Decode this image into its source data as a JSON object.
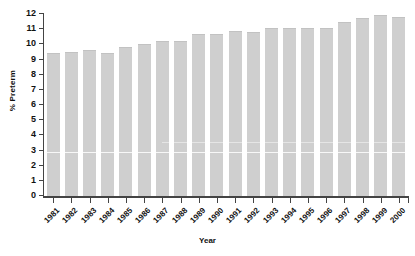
{
  "chart_data": {
    "type": "bar",
    "title": "",
    "xlabel": "Year",
    "ylabel": "% Preterm",
    "categories": [
      "1981",
      "1982",
      "1983",
      "1984",
      "1985",
      "1986",
      "1987",
      "1988",
      "1989",
      "1990",
      "1991",
      "1992",
      "1993",
      "1994",
      "1995",
      "1996",
      "1997",
      "1998",
      "1999",
      "2000"
    ],
    "values": [
      9.4,
      9.5,
      9.6,
      9.4,
      9.8,
      10.0,
      10.25,
      10.25,
      10.65,
      10.65,
      10.9,
      10.8,
      11.05,
      11.05,
      11.05,
      11.05,
      11.5,
      11.75,
      11.95,
      11.8
    ],
    "ylim": [
      0,
      12
    ],
    "ytick_labels": [
      "0",
      "1",
      "2",
      "3",
      "4",
      "5",
      "6",
      "7",
      "8",
      "9",
      "10",
      "11",
      "12"
    ],
    "ytick_values": [
      0,
      1,
      2,
      3,
      4,
      5,
      6,
      7,
      8,
      9,
      10,
      11,
      12
    ],
    "grid": false,
    "legend": null,
    "bar_color": "#cfcfcf",
    "axis_color": "#444444",
    "background": "#ffffff"
  }
}
